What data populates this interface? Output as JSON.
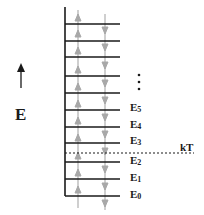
{
  "diagram": {
    "type": "energy-level-diagram",
    "axis_label": "E",
    "threshold_label": "kT",
    "ellipsis": "⋮",
    "levels_labeled": [
      {
        "name": "E",
        "sub": "0",
        "y": 196
      },
      {
        "name": "E",
        "sub": "1",
        "y": 179
      },
      {
        "name": "E",
        "sub": "2",
        "y": 162
      },
      {
        "name": "E",
        "sub": "3",
        "y": 143
      },
      {
        "name": "E",
        "sub": "4",
        "y": 127
      },
      {
        "name": "E",
        "sub": "5",
        "y": 110
      }
    ],
    "levels_unlabeled_y": [
      24,
      41,
      57,
      76,
      93
    ],
    "threshold_y": 153,
    "colors": {
      "line": "#1a1a1a",
      "transition_arrows": "#a8a8a8"
    },
    "transitions": {
      "upward_x": 78,
      "downward_x": 105
    }
  }
}
